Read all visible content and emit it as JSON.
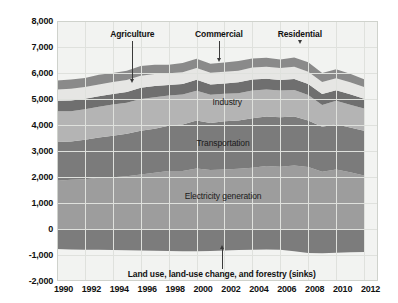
{
  "chart_data": {
    "type": "area",
    "stacked": true,
    "title": "",
    "xlabel": "",
    "ylabel": "",
    "grid": true,
    "legend_position": "in-plot annotations",
    "x": [
      1990,
      1991,
      1992,
      1993,
      1994,
      1995,
      1996,
      1997,
      1998,
      1999,
      2000,
      2001,
      2002,
      2003,
      2004,
      2005,
      2006,
      2007,
      2008,
      2009,
      2010,
      2011,
      2012
    ],
    "xlim": [
      1990,
      2013
    ],
    "ylim": [
      -2000,
      8000
    ],
    "ytick_labels": [
      "8,000",
      "7,000",
      "6,000",
      "5,000",
      "4,000",
      "3,000",
      "2,000",
      "1,000",
      "0",
      "-1,000",
      "-2,000"
    ],
    "ytick_values": [
      8000,
      7000,
      6000,
      5000,
      4000,
      3000,
      2000,
      1000,
      0,
      -1000,
      -2000
    ],
    "xtick_labels": [
      "1990",
      "1992",
      "1994",
      "1996",
      "1998",
      "2000",
      "2002",
      "2004",
      "2006",
      "2008",
      "2010",
      "2012"
    ],
    "xtick_values": [
      1990,
      1992,
      1994,
      1996,
      1998,
      2000,
      2002,
      2004,
      2006,
      2008,
      2010,
      2012
    ],
    "series": [
      {
        "name": "Electricity generation",
        "color": "#9d9d9d",
        "label_in_plot": "Electricity generation",
        "values": [
          1860,
          1890,
          1910,
          1970,
          1990,
          2030,
          2100,
          2160,
          2230,
          2230,
          2330,
          2270,
          2290,
          2320,
          2360,
          2420,
          2390,
          2440,
          2380,
          2200,
          2290,
          2180,
          2060
        ]
      },
      {
        "name": "Transportation",
        "color": "#7b7b7b",
        "label_in_plot": "Transportation",
        "values": [
          1490,
          1480,
          1520,
          1550,
          1600,
          1630,
          1680,
          1700,
          1740,
          1790,
          1840,
          1810,
          1850,
          1850,
          1900,
          1910,
          1910,
          1890,
          1790,
          1730,
          1740,
          1720,
          1720
        ]
      },
      {
        "name": "Industry",
        "color": "#b4b4b4",
        "label_in_plot": "Industry",
        "values": [
          1180,
          1160,
          1180,
          1180,
          1200,
          1200,
          1220,
          1210,
          1160,
          1150,
          1150,
          1080,
          1060,
          1050,
          1070,
          1040,
          1030,
          1020,
          980,
          840,
          900,
          880,
          850
        ]
      },
      {
        "name": "Commercial",
        "color": "#6f6f6f",
        "label_in_plot": "",
        "callout": "Commercial",
        "values": [
          400,
          410,
          400,
          410,
          400,
          410,
          430,
          430,
          410,
          410,
          420,
          400,
          400,
          420,
          420,
          410,
          400,
          420,
          430,
          420,
          410,
          400,
          380
        ]
      },
      {
        "name": "Agriculture",
        "color": "#e6e6e4",
        "label_in_plot": "",
        "callout": "Agriculture",
        "values": [
          440,
          450,
          450,
          450,
          460,
          460,
          460,
          460,
          450,
          450,
          450,
          450,
          450,
          450,
          460,
          460,
          460,
          470,
          470,
          460,
          460,
          460,
          450
        ]
      },
      {
        "name": "Residential",
        "color": "#8a8a8a",
        "label_in_plot": "",
        "callout": "Residential",
        "values": [
          340,
          360,
          350,
          370,
          350,
          360,
          380,
          360,
          330,
          350,
          360,
          350,
          350,
          370,
          350,
          350,
          330,
          360,
          360,
          350,
          340,
          330,
          300
        ]
      },
      {
        "name": "Land use, land-use change, and forestry (sinks)",
        "color": "#7c7c7c",
        "label_in_plot": "",
        "callout": "Land use, land-use change, and forestry (sinks)",
        "negative": true,
        "values": [
          -770,
          -790,
          -800,
          -800,
          -810,
          -820,
          -830,
          -840,
          -850,
          -860,
          -860,
          -850,
          -830,
          -810,
          -800,
          -790,
          -800,
          -860,
          -920,
          -930,
          -910,
          -890,
          -880
        ]
      }
    ],
    "annotations": [
      {
        "name": "agriculture-callout",
        "text": "Agriculture",
        "x_year": 1995.4,
        "text_y": 7460,
        "target_y": 5620,
        "direction": "down"
      },
      {
        "name": "commercial-callout",
        "text": "Commercial",
        "x_year": 2001.6,
        "text_y": 7460,
        "target_y": 6430,
        "direction": "down"
      },
      {
        "name": "residential-callout",
        "text": "Residential",
        "x_year": 2007.4,
        "text_y": 7460,
        "target_y": 7110,
        "direction": "down"
      },
      {
        "name": "landuse-callout",
        "text": "Land use, land-use change, and forestry (sinks)",
        "x_year": 2001.8,
        "text_y": -1700,
        "target_y": -620,
        "direction": "up"
      }
    ],
    "in_plot_labels": [
      {
        "name": "industry-label",
        "text": "Industry",
        "x_year": 2002.2,
        "y_value": 4870
      },
      {
        "name": "transportation-label",
        "text": "Transportation",
        "x_year": 2001.9,
        "y_value": 3300
      },
      {
        "name": "electricity-label",
        "text": "Electricity generation",
        "x_year": 2001.9,
        "y_value": 1260
      }
    ],
    "colors": {
      "plot_background": "#f2f3f1",
      "gridline": "#dfe1dd",
      "border": "#cfd2cc",
      "text": "#111111",
      "page_background": "#ffffff"
    }
  }
}
